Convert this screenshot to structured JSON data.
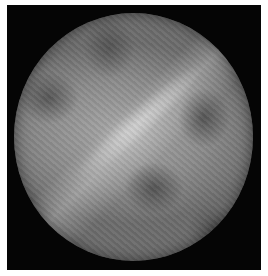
{
  "image": {
    "description": "Grayscale circular disk with wavy fringe texture on black square background",
    "colors": {
      "background": "#050505",
      "disk_mid": "#8a8a8a",
      "highlight": "#e6e6e6",
      "dark_spots": "#282828"
    },
    "features": [
      {
        "name": "bright-diagonal-streak",
        "position": "center, oriented lower-left to upper-right"
      },
      {
        "name": "dark-spot-lower-center"
      },
      {
        "name": "dark-spot-right"
      },
      {
        "name": "dark-spot-left"
      },
      {
        "name": "dark-spot-top"
      }
    ]
  }
}
